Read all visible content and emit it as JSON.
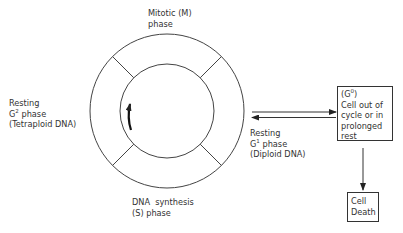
{
  "cycle": {
    "mitotic": {
      "line1": "Mitotic (M)",
      "line2": "phase"
    },
    "g2": {
      "line1": "Resting",
      "line2_prefix": "G",
      "line2_sup": "2",
      "line2_suffix": " phase",
      "line3": "(Tetraploid DNA)"
    },
    "s": {
      "line1": "DNA  synthesis",
      "line2": "(S) phase"
    },
    "g1": {
      "line1": "Resting",
      "line2_prefix": "G",
      "line2_sup": "1",
      "line2_suffix": " phase",
      "line3": "(Diploid DNA)"
    },
    "direction_arrow": "counterclockwise-arrow"
  },
  "g0_box": {
    "line1_prefix": "(G",
    "line1_sup": "0",
    "line1_suffix": ")",
    "line2": "Cell out of",
    "line3": "cycle or in",
    "line4": "prolonged",
    "line5": "rest"
  },
  "death_box": {
    "line1": "Cell",
    "line2": "Death"
  },
  "colors": {
    "stroke": "#333333",
    "background": "#ffffff"
  }
}
